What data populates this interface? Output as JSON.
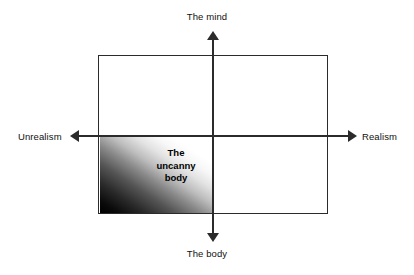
{
  "diagram": {
    "background_color": "#ffffff",
    "line_color": "#2b2b2b",
    "gradient_dark_color": "#000000",
    "gradient_light_color": "#ffffff",
    "axes": {
      "vertical": {
        "top_label": "The mind",
        "bottom_label": "The body"
      },
      "horizontal": {
        "left_label": "Unrealism",
        "right_label": "Realism"
      }
    },
    "regions": [
      {
        "name": "uncanny-body",
        "quadrant": "lower-left",
        "lines": [
          "The",
          "uncanny",
          "body"
        ]
      }
    ]
  },
  "chart_data": {
    "type": "scatter",
    "title": "",
    "xlabel": "",
    "ylabel": "",
    "axis_labels": {
      "x_negative": "Unrealism",
      "x_positive": "Realism",
      "y_positive": "The mind",
      "y_negative": "The body"
    },
    "grid": false,
    "legend": "none",
    "annotations": [
      {
        "text": "The uncanny body",
        "quadrant": "lower-left",
        "shading": "linear gradient, black at lower-left corner fading to white toward upper-right"
      }
    ]
  }
}
